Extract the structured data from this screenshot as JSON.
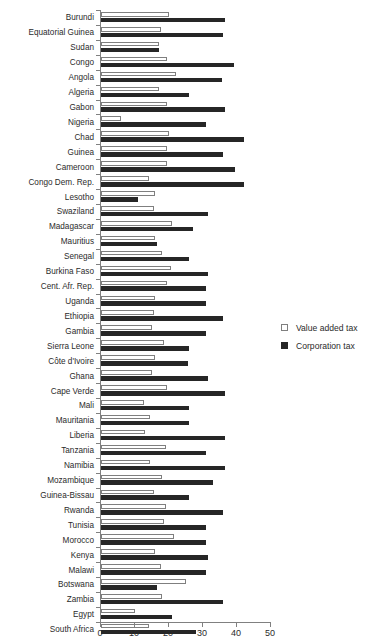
{
  "chart_data": {
    "type": "bar",
    "orientation": "horizontal",
    "title": "",
    "xlabel": "",
    "ylabel": "",
    "xlim": [
      0,
      50
    ],
    "xticks": [
      0,
      10,
      20,
      30,
      40,
      50
    ],
    "grid": false,
    "legend_position": "right",
    "categories": [
      "Burundi",
      "Equatorial Guinea",
      "Sudan",
      "Congo",
      "Angola",
      "Algeria",
      "Gabon",
      "Nigeria",
      "Chad",
      "Guinea",
      "Cameroon",
      "Congo Dem. Rep.",
      "Lesotho",
      "Swaziland",
      "Madagascar",
      "Mauritius",
      "Senegal",
      "Burkina Faso",
      "Cent. Afr. Rep.",
      "Uganda",
      "Ethiopia",
      "Gambia",
      "Sierra Leone",
      "Côte d'Ivoire",
      "Ghana",
      "Cape Verde",
      "Mali",
      "Mauritania",
      "Liberia",
      "Tanzania",
      "Namibia",
      "Mozambique",
      "Guinea-Bissau",
      "Rwanda",
      "Tunisia",
      "Morocco",
      "Kenya",
      "Malawi",
      "Botswana",
      "Zambia",
      "Egypt",
      "South Africa"
    ],
    "series": [
      {
        "name": "Value added tax",
        "color": "#ffffff",
        "edge_color": "#7f7f7f",
        "values": [
          20.0,
          17.5,
          17.0,
          19.5,
          22.0,
          17.0,
          19.5,
          6.0,
          20.0,
          19.5,
          19.5,
          14.0,
          16.0,
          15.5,
          21.0,
          16.0,
          18.0,
          20.5,
          19.5,
          16.0,
          15.5,
          15.0,
          18.5,
          16.0,
          15.0,
          19.5,
          12.5,
          14.5,
          13.0,
          19.0,
          14.5,
          18.0,
          15.5,
          19.0,
          18.5,
          21.5,
          16.0,
          17.5,
          25.0,
          18.0,
          10.0,
          14.0
        ]
      },
      {
        "name": "Corporation tax",
        "color": "#262626",
        "values": [
          36.5,
          36.0,
          17.0,
          39.0,
          35.5,
          26.0,
          36.5,
          31.0,
          42.0,
          36.0,
          39.5,
          42.0,
          11.0,
          31.5,
          27.0,
          16.5,
          26.0,
          31.5,
          31.0,
          31.0,
          36.0,
          31.0,
          26.0,
          25.5,
          31.5,
          36.5,
          26.0,
          26.0,
          36.5,
          31.0,
          36.5,
          33.0,
          26.0,
          36.0,
          31.0,
          31.0,
          31.5,
          31.0,
          16.5,
          36.0,
          21.0,
          28.0
        ]
      }
    ]
  },
  "legend": {
    "items": [
      {
        "label": "Value added tax"
      },
      {
        "label": "Corporation tax"
      }
    ]
  }
}
